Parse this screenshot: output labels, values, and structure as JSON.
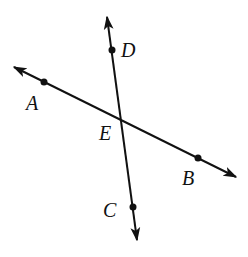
{
  "diagram": {
    "type": "intersecting-lines",
    "background": "#ffffff",
    "stroke_color": "#111111",
    "lines": [
      {
        "name": "line-AB",
        "from": [
          14,
          67
        ],
        "to": [
          236,
          177
        ],
        "arrows": "both",
        "points": [
          "A",
          "E",
          "B"
        ]
      },
      {
        "name": "line-DC",
        "from": [
          107,
          17
        ],
        "to": [
          137,
          240
        ],
        "arrows": "both",
        "points": [
          "D",
          "E",
          "C"
        ]
      }
    ],
    "points": [
      {
        "id": "A",
        "label": "A",
        "x": 44,
        "y": 82,
        "label_x": 26,
        "label_y": 110,
        "dot": true
      },
      {
        "id": "B",
        "label": "B",
        "x": 198,
        "y": 158,
        "label_x": 182,
        "label_y": 185,
        "dot": true
      },
      {
        "id": "C",
        "label": "C",
        "x": 133,
        "y": 207,
        "label_x": 103,
        "label_y": 217,
        "dot": true
      },
      {
        "id": "D",
        "label": "D",
        "x": 112,
        "y": 50,
        "label_x": 121,
        "label_y": 57,
        "dot": true
      },
      {
        "id": "E",
        "label": "E",
        "x": 121,
        "y": 120,
        "label_x": 99,
        "label_y": 140,
        "dot": false
      }
    ]
  }
}
